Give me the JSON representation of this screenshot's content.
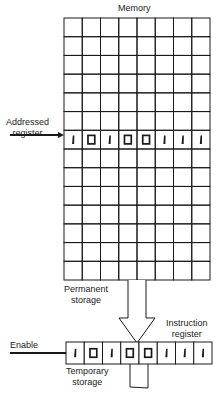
{
  "diagram": {
    "memory": {
      "title": "Memory",
      "rows": 14,
      "columns": 8,
      "addressed_row_index": 6,
      "addressed_register_label_line1": "Addressed",
      "addressed_register_label_line2": "register",
      "addressed_register_bits": [
        1,
        0,
        1,
        0,
        0,
        1,
        1,
        1
      ],
      "permanent_storage_label_line1": "Permanent",
      "permanent_storage_label_line2": "storage"
    },
    "instruction_register": {
      "label_line1": "Instruction",
      "label_line2": "register",
      "bits": [
        1,
        0,
        1,
        0,
        0,
        1,
        1,
        1
      ],
      "temporary_storage_label_line1": "Temporary",
      "temporary_storage_label_line2": "storage"
    },
    "enable_label": "Enable",
    "colors": {
      "line": "#1a1a1a",
      "background": "#ffffff"
    }
  }
}
